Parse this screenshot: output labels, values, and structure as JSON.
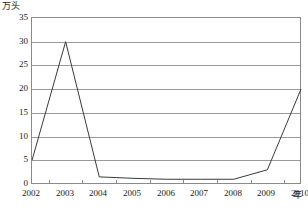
{
  "chart_data": {
    "type": "line",
    "title": "",
    "subtitle": "",
    "xlabel": "年",
    "ylabel": "万头",
    "y_unit_caption": "万头",
    "x_unit_caption": "年",
    "categories": [
      "2002",
      "2003",
      "2004",
      "2005",
      "2006",
      "2007",
      "2008",
      "2009",
      "2010"
    ],
    "x": [
      2002,
      2003,
      2004,
      2005,
      2006,
      2007,
      2008,
      2009,
      2010
    ],
    "values": [
      5,
      30,
      1.5,
      1.2,
      1,
      1,
      1,
      3,
      20
    ],
    "series": [
      {
        "name": "",
        "values": [
          5,
          30,
          1.5,
          1.2,
          1,
          1,
          1,
          3,
          20
        ]
      }
    ],
    "ylim": [
      0,
      35
    ],
    "xlim": [
      2002,
      2010
    ],
    "yticks": [
      0,
      5,
      10,
      15,
      20,
      25,
      30,
      35
    ],
    "ytick_labels": [
      "0",
      "5",
      "10",
      "15",
      "20",
      "25",
      "30",
      "35"
    ],
    "xtick_labels": [
      "2002",
      "2003",
      "2004",
      "2005",
      "2006",
      "2007",
      "2008",
      "2009",
      "2010"
    ],
    "grid": true,
    "grid_axis": "y",
    "legend": false,
    "legend_position": "none",
    "line_color": "#3a3a3a",
    "grid_color": "#9a9a9a",
    "frame_color": "#8a8a8a",
    "background_color": "#ffffff",
    "markers": false,
    "annotations": []
  }
}
